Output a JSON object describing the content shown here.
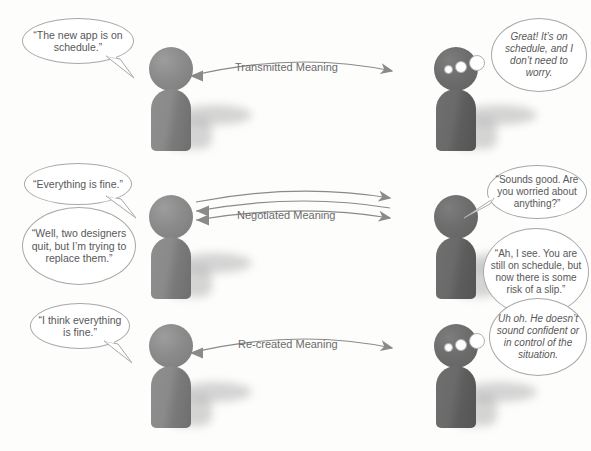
{
  "diagram": {
    "background_color": "#fdfdfc",
    "figure_light_color": "#8b8b8b",
    "figure_dark_color": "#6d6d6d",
    "bubble_stroke_color": "#a8a8a8",
    "text_color": "#585858",
    "arrow_color": "#8a8a8a"
  },
  "rows": [
    {
      "id": "row-transmitted",
      "arrow_label": "Transmitted Meaning",
      "arrow_style": "single-right",
      "arrow_count": 1,
      "sender": {
        "role": "sender",
        "shade": "light",
        "bubbles": [
          {
            "kind": "speech",
            "text": "“The new app is on schedule.”"
          }
        ]
      },
      "receiver": {
        "role": "receiver",
        "shade": "dark",
        "bubbles": [
          {
            "kind": "thought",
            "text": "Great! It’s on schedule, and I don’t need to worry."
          }
        ]
      }
    },
    {
      "id": "row-negotiated",
      "arrow_label": "Negotiated Meaning",
      "arrow_style": "bidirectional",
      "arrow_count": 3,
      "sender": {
        "role": "sender",
        "shade": "light",
        "bubbles": [
          {
            "kind": "speech",
            "text": "“Everything is fine.”"
          },
          {
            "kind": "speech",
            "text": "“Well, two designers quit, but I’m trying to replace them.”"
          }
        ]
      },
      "receiver": {
        "role": "receiver",
        "shade": "dark",
        "bubbles": [
          {
            "kind": "speech",
            "text": "“Sounds good. Are you worried about anything?”"
          },
          {
            "kind": "speech",
            "text": "“Ah, I see. You are still on schedule, but now there is some risk of a slip.”"
          }
        ]
      }
    },
    {
      "id": "row-recreated",
      "arrow_label": "Re-created Meaning",
      "arrow_style": "single-right",
      "arrow_count": 1,
      "sender": {
        "role": "sender",
        "shade": "light",
        "bubbles": [
          {
            "kind": "speech",
            "text": "“I think everything is fine.”"
          }
        ]
      },
      "receiver": {
        "role": "receiver",
        "shade": "dark",
        "bubbles": [
          {
            "kind": "thought",
            "text": "Uh oh. He doesn’t sound confident or in control of the situation."
          }
        ]
      }
    }
  ]
}
